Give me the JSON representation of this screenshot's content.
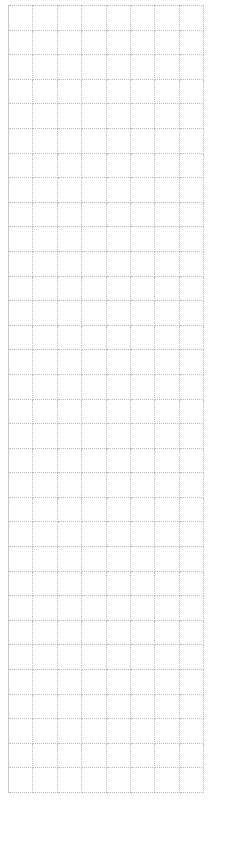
{
  "grid": {
    "rows": 32,
    "columns": 8,
    "cells": []
  },
  "colors": {
    "background": "#ffffff",
    "gridline": "#b8b8b8",
    "left_border": "#c8c8c8"
  }
}
